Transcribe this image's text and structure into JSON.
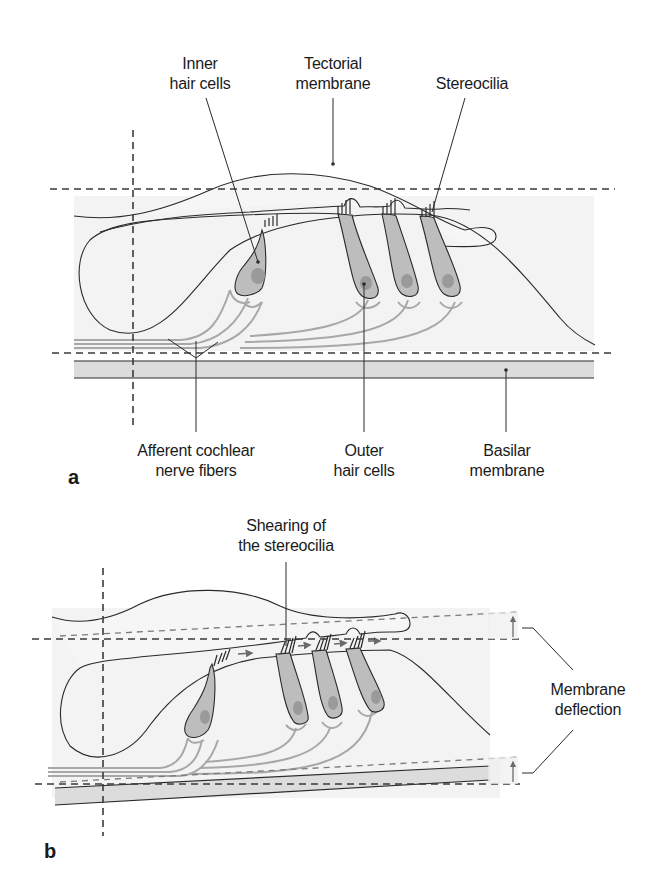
{
  "panel_a": {
    "letter": "a",
    "labels": {
      "inner_hair_cells_1": "Inner",
      "inner_hair_cells_2": "hair cells",
      "tectorial_1": "Tectorial",
      "tectorial_2": "membrane",
      "stereocilia": "Stereocilia",
      "afferent_1": "Afferent cochlear",
      "afferent_2": "nerve fibers",
      "outer_1": "Outer",
      "outer_2": "hair cells",
      "basilar_1": "Basilar",
      "basilar_2": "membrane"
    }
  },
  "panel_b": {
    "letter": "b",
    "labels": {
      "shearing_1": "Shearing of",
      "shearing_2": "the stereocilia",
      "deflection_1": "Membrane",
      "deflection_2": "deflection"
    }
  },
  "colors": {
    "outline": "#2a2a2a",
    "cell_fill": "#bdbdbd",
    "nucleus": "#9a9a9a",
    "tissue_fill": "#f2f2f2",
    "basilar_fill": "#dcdcdc",
    "nerve": "#a8a8a8"
  }
}
